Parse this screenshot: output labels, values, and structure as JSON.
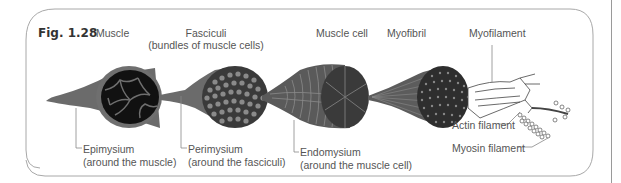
{
  "figure": {
    "number": "Fig. 1.28",
    "headings": {
      "muscle": "Muscle",
      "fasciculi": "Fasciculi",
      "fasciculi_sub": "(bundles of muscle cells)",
      "muscle_cell": "Muscle cell",
      "myofibril": "Myofibril",
      "myofilament": "Myofilament"
    },
    "callouts": {
      "epimysium": "Epimysium",
      "epimysium_sub": "(around the muscle)",
      "perimysium": "Perimysium",
      "perimysium_sub": "(around the fasciculi)",
      "endomysium": "Endomysium",
      "endomysium_sub": "(around the muscle cell)",
      "actin": "Actin filament",
      "myosin": "Myosin filament"
    },
    "colors": {
      "tissue": "#6b6b6b",
      "dark": "#111111",
      "frame": "#a0a0a0",
      "text": "#4a4a4a"
    }
  }
}
